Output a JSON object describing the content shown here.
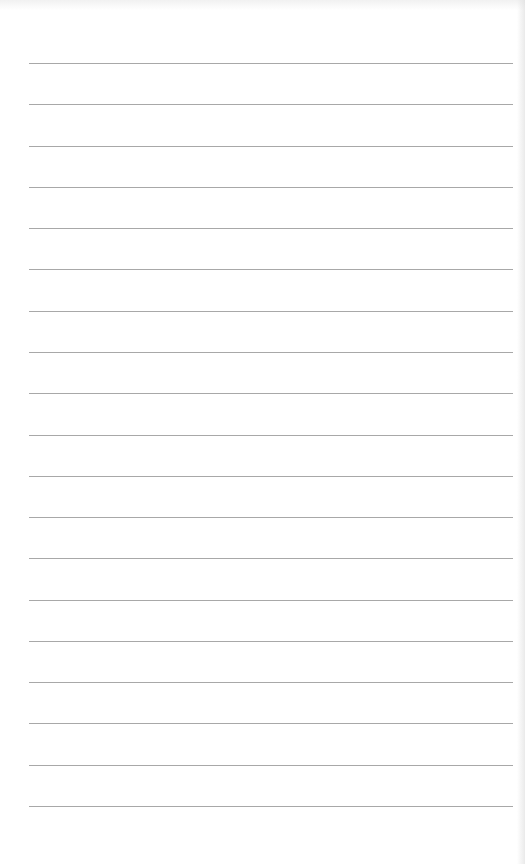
{
  "page": {
    "type": "lined-paper",
    "background_color": "#ffffff",
    "rule_color": "#a8a8a8",
    "rule_count": 19,
    "rules_y": [
      63,
      104,
      146,
      187,
      228,
      269,
      311,
      352,
      393,
      435,
      476,
      517,
      558,
      600,
      641,
      682,
      723,
      765,
      806
    ],
    "rule_x_start": 29,
    "rule_x_end": 513
  }
}
